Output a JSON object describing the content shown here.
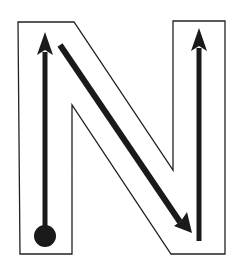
{
  "diagram": {
    "title": "Letter N stroke order guide",
    "letter": "N",
    "colors": {
      "background": "#ffffff",
      "outline": "#222222",
      "stroke": "#1a1a1a"
    },
    "strokes": [
      {
        "order": 1,
        "direction": "up",
        "description": "Left vertical stroke from start dot upward"
      },
      {
        "order": 2,
        "direction": "diagonal-down-right",
        "description": "Diagonal stroke from top-left to bottom-right"
      },
      {
        "order": 3,
        "direction": "up",
        "description": "Right vertical stroke upward"
      }
    ],
    "start_marker": "dot"
  }
}
